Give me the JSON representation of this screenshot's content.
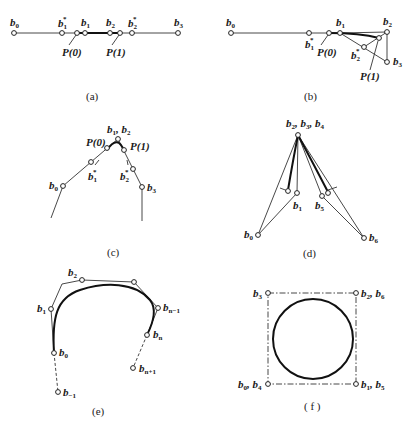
{
  "figure": {
    "panels": [
      {
        "id": "a",
        "caption": "(a)",
        "labels": {
          "b0": "b",
          "b0_sub": "0",
          "b1s": "b",
          "b1s_sub": "1",
          "b1s_sup": "*",
          "b1": "b",
          "b1_sub": "1",
          "b2": "b",
          "b2_sub": "2",
          "b2s": "b",
          "b2s_sub": "2",
          "b2s_sup": "*",
          "b3": "b",
          "b3_sub": "3",
          "p0": "P(0)",
          "p1": "P(1)"
        }
      },
      {
        "id": "b",
        "caption": "(b)",
        "labels": {
          "b0": "b",
          "b0_sub": "0",
          "b1s": "b",
          "b1s_sub": "1",
          "b1s_sup": "*",
          "b1": "b",
          "b1_sub": "1",
          "b2": "b",
          "b2_sub": "2",
          "b2s": "b",
          "b2s_sub": "2",
          "b2s_sup": "*",
          "b3": "b",
          "b3_sub": "3",
          "p0": "P(0)",
          "p1": "P(1)"
        }
      },
      {
        "id": "c",
        "caption": "(c)",
        "labels": {
          "b12": "b",
          "b12_sub1": "1",
          "b12_sep": ", b",
          "b12_sub2": "2",
          "b0": "b",
          "b0_sub": "0",
          "b1s": "b",
          "b1s_sub": "1",
          "b1s_sup": "*",
          "b2s": "b",
          "b2s_sub": "2",
          "b2s_sup": "*",
          "b3": "b",
          "b3_sub": "3",
          "p0": "P(0)",
          "p1": "P(1)"
        }
      },
      {
        "id": "d",
        "caption": "(d)",
        "labels": {
          "top": "b",
          "top_sub1": "2",
          "top_sep1": ", b",
          "top_sub2": "3",
          "top_sep2": ", b",
          "top_sub3": "4",
          "b0": "b",
          "b0_sub": "0",
          "b1": "b",
          "b1_sub": "1",
          "b5": "b",
          "b5_sub": "5",
          "b6": "b",
          "b6_sub": "6"
        }
      },
      {
        "id": "e",
        "caption": "(e)",
        "labels": {
          "b2": "b",
          "b2_sub": "2",
          "b1": "b",
          "b1_sub": "1",
          "b0": "b",
          "b0_sub": "0",
          "bm1": "b",
          "bm1_sub": "−1",
          "bn1": "b",
          "bn1_sub": "n−1",
          "bn": "b",
          "bn_sub": "n",
          "bnp1": "b",
          "bnp1_sub": "n+1"
        }
      },
      {
        "id": "f",
        "caption": "( f )",
        "labels": {
          "b3": "b",
          "b3_sub": "3",
          "b26": "b",
          "b26_sub1": "2",
          "b26_sep": ", b",
          "b26_sub2": "6",
          "b04": "b",
          "b04_sub1": "0",
          "b04_sep": ", b",
          "b04_sub2": "4",
          "b15": "b",
          "b15_sub1": "1",
          "b15_sep": ", b",
          "b15_sub2": "5"
        }
      }
    ]
  }
}
